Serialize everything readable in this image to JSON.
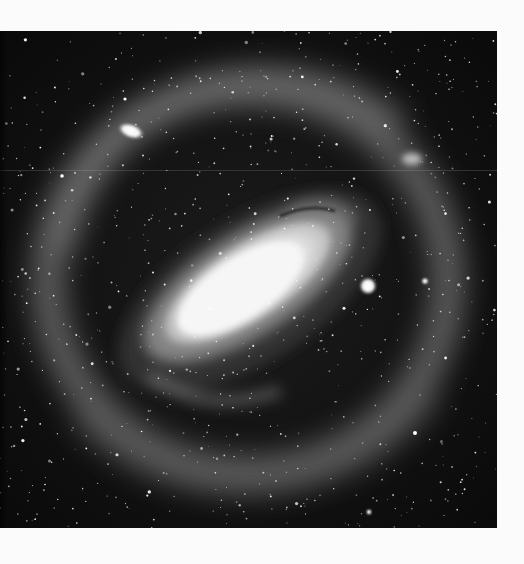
{
  "image": {
    "subject": "ringed-barred-galaxy",
    "style": "black-and-white astronomical photograph",
    "alt": "Barred spiral galaxy surrounded by a faint outer ring, with a small elliptical companion and a bright foreground star against a dense starfield",
    "frame": {
      "x": 0,
      "y": 31,
      "width": 497,
      "height": 497
    },
    "colors": {
      "page_background": "#fbfbfb",
      "sky": "#0f0f0f",
      "ring_glow": "#6e6e6e",
      "galaxy_core": "#f2f2f2",
      "star": "#ffffff"
    }
  },
  "features": {
    "galaxy": {
      "label": "Central barred galaxy",
      "cx": 250,
      "cy": 252,
      "rx": 110,
      "ry": 44,
      "angle": -33
    },
    "ring": {
      "label": "Outer ring",
      "cx": 248,
      "cy": 255,
      "rx": 205,
      "ry": 195
    },
    "companion": {
      "label": "Elliptical companion",
      "cx": 131,
      "cy": 100,
      "rx": 14,
      "ry": 7,
      "angle": 20
    },
    "bright_star": {
      "label": "Foreground star",
      "cx": 368,
      "cy": 255,
      "r": 8
    },
    "ring_knot": {
      "label": "Ring knot",
      "cx": 412,
      "cy": 128,
      "r": 7
    }
  }
}
